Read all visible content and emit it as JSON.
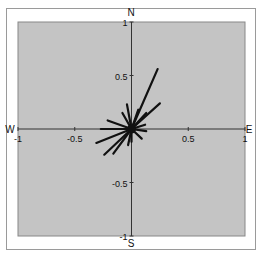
{
  "chart_data": {
    "type": "polar-vector-rose",
    "title": "",
    "xlabel": "",
    "ylabel": "",
    "xlim": [
      -1,
      1
    ],
    "ylim": [
      -1,
      1
    ],
    "grid": false,
    "legend": null,
    "directions": {
      "north": "N",
      "south": "S",
      "east": "E",
      "west": "W"
    },
    "x_ticks": [
      {
        "value": -1,
        "label": "-1"
      },
      {
        "value": -0.5,
        "label": "-0.5"
      },
      {
        "value": 0.5,
        "label": "0.5"
      },
      {
        "value": 1,
        "label": "1"
      }
    ],
    "y_ticks": [
      {
        "value": 1,
        "label": "1"
      },
      {
        "value": 0.5,
        "label": "0.5"
      },
      {
        "value": -0.5,
        "label": "-0.5"
      },
      {
        "value": -1,
        "label": "-1"
      }
    ],
    "vectors": [
      {
        "x": 0.23,
        "y": 0.56
      },
      {
        "x": 0.25,
        "y": 0.24
      },
      {
        "x": 0.06,
        "y": 0.18
      },
      {
        "x": 0.13,
        "y": 0.15
      },
      {
        "x": -0.04,
        "y": 0.23
      },
      {
        "x": -0.08,
        "y": 0.15
      },
      {
        "x": -0.21,
        "y": 0.08
      },
      {
        "x": -0.27,
        "y": 0.0
      },
      {
        "x": -0.31,
        "y": -0.13
      },
      {
        "x": -0.24,
        "y": -0.24
      },
      {
        "x": -0.16,
        "y": -0.23
      },
      {
        "x": 0.12,
        "y": 0.04
      },
      {
        "x": 0.13,
        "y": -0.02
      },
      {
        "x": 0.09,
        "y": -0.09
      },
      {
        "x": 0.0,
        "y": -0.12
      },
      {
        "x": -0.03,
        "y": -0.15
      }
    ]
  },
  "colors": {
    "plot_background": "#c4c4c4",
    "frame": "#888888",
    "axis": "#333333",
    "vector": "#111111"
  }
}
